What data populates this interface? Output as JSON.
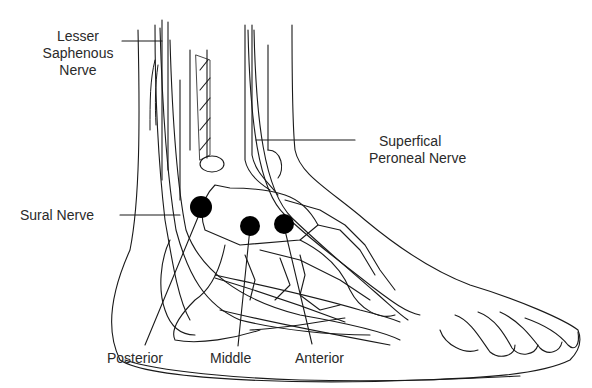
{
  "diagram": {
    "labels": {
      "lesser_saphenous": [
        "Lesser",
        "Saphenous",
        "Nerve"
      ],
      "superficial_peroneal": [
        "Superfical",
        "Peroneal Nerve"
      ],
      "sural": "Sural Nerve",
      "posterior": "Posterior",
      "middle": "Middle",
      "anterior": "Anterior"
    },
    "points": [
      {
        "name": "Posterior",
        "cx": 201,
        "cy": 207
      },
      {
        "name": "Middle",
        "cx": 250,
        "cy": 226
      },
      {
        "name": "Anterior",
        "cx": 284,
        "cy": 224
      }
    ],
    "colors": {
      "ink": "#1a1a1a",
      "dot": "#000000",
      "text": "#2a2a2a"
    }
  }
}
